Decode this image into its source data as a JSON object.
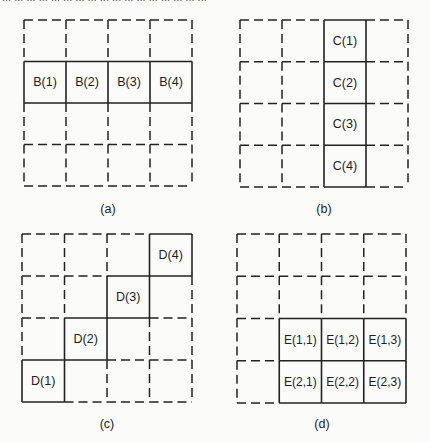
{
  "figure": {
    "top_caption_fragment": "... ... ... ... ... ... ... ... ... ... ... ... ... ... ... ... ..."
  },
  "panels": [
    {
      "id": "a",
      "caption": "(a)",
      "grid": {
        "rows": 4,
        "cols": 4
      },
      "highlight": "row 2",
      "cells": [
        {
          "row": 1,
          "col": 0,
          "label": "B(1)"
        },
        {
          "row": 1,
          "col": 1,
          "label": "B(2)"
        },
        {
          "row": 1,
          "col": 2,
          "label": "B(3)"
        },
        {
          "row": 1,
          "col": 3,
          "label": "B(4)"
        }
      ]
    },
    {
      "id": "b",
      "caption": "(b)",
      "grid": {
        "rows": 4,
        "cols": 4
      },
      "highlight": "column 3",
      "cells": [
        {
          "row": 0,
          "col": 2,
          "label": "C(1)"
        },
        {
          "row": 1,
          "col": 2,
          "label": "C(2)"
        },
        {
          "row": 2,
          "col": 2,
          "label": "C(3)"
        },
        {
          "row": 3,
          "col": 2,
          "label": "C(4)"
        }
      ]
    },
    {
      "id": "c",
      "caption": "(c)",
      "grid": {
        "rows": 4,
        "cols": 4
      },
      "highlight": "anti-diagonal",
      "cells": [
        {
          "row": 3,
          "col": 0,
          "label": "D(1)"
        },
        {
          "row": 2,
          "col": 1,
          "label": "D(2)"
        },
        {
          "row": 1,
          "col": 2,
          "label": "D(3)"
        },
        {
          "row": 0,
          "col": 3,
          "label": "D(4)"
        }
      ]
    },
    {
      "id": "d",
      "caption": "(d)",
      "grid": {
        "rows": 4,
        "cols": 4
      },
      "highlight": "lower-right 2x3 block",
      "cells": [
        {
          "row": 2,
          "col": 1,
          "label": "E(1,1)"
        },
        {
          "row": 2,
          "col": 2,
          "label": "E(1,2)"
        },
        {
          "row": 2,
          "col": 3,
          "label": "E(1,3)"
        },
        {
          "row": 3,
          "col": 1,
          "label": "E(2,1)"
        },
        {
          "row": 3,
          "col": 2,
          "label": "E(2,2)"
        },
        {
          "row": 3,
          "col": 3,
          "label": "E(2,3)"
        }
      ]
    }
  ]
}
